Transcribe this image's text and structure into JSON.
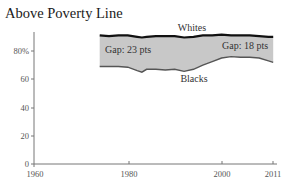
{
  "chart_data": {
    "type": "area",
    "title": "Above Poverty Line",
    "xlabel": "",
    "ylabel": "",
    "xlim": [
      1960,
      2011
    ],
    "ylim": [
      0,
      90
    ],
    "x_ticks": [
      "1960",
      "1980",
      "2000",
      "2011"
    ],
    "y_ticks": [
      "0",
      "20",
      "40",
      "60",
      "80%"
    ],
    "grid": false,
    "legend": "inline labels",
    "x": [
      1974,
      1976,
      1978,
      1980,
      1982,
      1983,
      1984,
      1986,
      1988,
      1990,
      1992,
      1994,
      1996,
      1998,
      2000,
      2002,
      2004,
      2006,
      2008,
      2010,
      2011
    ],
    "series": [
      {
        "name": "Whites",
        "values": [
          91,
          90.5,
          91,
          91,
          90,
          89.5,
          90,
          90.5,
          90.5,
          90.5,
          89.5,
          90,
          91,
          91,
          91.5,
          91,
          91,
          91,
          90.5,
          90,
          90
        ]
      },
      {
        "name": "Blacks",
        "values": [
          69,
          69,
          69,
          68.5,
          66,
          65,
          67,
          67,
          66.5,
          67,
          65.5,
          67,
          70,
          72.5,
          75,
          76,
          75.5,
          75.5,
          75,
          73,
          72
        ]
      }
    ],
    "annotations": [
      "Gap: 23 pts",
      "Gap: 18 pts"
    ],
    "band_fill": "#c8c8c8",
    "line_color": "#111111"
  },
  "title": "Above Poverty Line",
  "labels": {
    "whites": "Whites",
    "blacks": "Blacks",
    "gap_start": "Gap: 23 pts",
    "gap_end": "Gap: 18 pts"
  },
  "axis": {
    "y": [
      "80%",
      "60",
      "40",
      "20",
      "0"
    ],
    "x": [
      "1960",
      "1980",
      "2000",
      "2011"
    ]
  }
}
